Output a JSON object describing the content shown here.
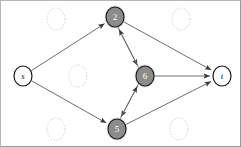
{
  "figure": {
    "type": "directed-graph",
    "title": "",
    "background_color": "#ffffff",
    "border_color": "#9a9a9a",
    "width": 241,
    "height": 147
  },
  "graph": {
    "node_fill_active": "#8c8c8c",
    "node_fill_terminal": "#ffffff",
    "node_stroke": "#1a1a1a",
    "node_text_active": "#ffffff",
    "node_text_terminal": "#1a1a1a",
    "edge_color": "#6e6e6e",
    "ghost_color": "#d9c9c9",
    "nodes": [
      {
        "id": "s",
        "label": "s",
        "x": 22,
        "y": 75,
        "rx": 9,
        "ry": 10,
        "style": "terminal",
        "italic": true
      },
      {
        "id": "n2",
        "label": "2",
        "x": 114,
        "y": 16,
        "rx": 9,
        "ry": 10,
        "style": "active",
        "italic": false
      },
      {
        "id": "n6",
        "label": "6",
        "x": 144,
        "y": 75,
        "rx": 9,
        "ry": 10,
        "style": "active",
        "italic": false
      },
      {
        "id": "n5",
        "label": "5",
        "x": 116,
        "y": 128,
        "rx": 9,
        "ry": 10,
        "style": "active",
        "italic": false
      },
      {
        "id": "t",
        "label": "t",
        "x": 221,
        "y": 75,
        "rx": 9,
        "ry": 10,
        "style": "terminal",
        "italic": true
      }
    ],
    "ghost_nodes": [
      {
        "id": "ghost-top-left",
        "x": 55,
        "y": 18,
        "rx": 9,
        "ry": 11
      },
      {
        "id": "ghost-top-right",
        "x": 180,
        "y": 18,
        "rx": 9,
        "ry": 11
      },
      {
        "id": "ghost-mid-left",
        "x": 77,
        "y": 75,
        "rx": 9,
        "ry": 11
      },
      {
        "id": "ghost-bottom-left",
        "x": 55,
        "y": 128,
        "rx": 9,
        "ry": 11
      },
      {
        "id": "ghost-bottom-right",
        "x": 178,
        "y": 128,
        "rx": 9,
        "ry": 11
      }
    ],
    "edges": [
      {
        "id": "s-to-2",
        "from": "s",
        "to": "n2",
        "label": "",
        "offset": 0
      },
      {
        "id": "s-to-5",
        "from": "s",
        "to": "n5",
        "label": "",
        "offset": 0
      },
      {
        "id": "2-to-6",
        "from": "n2",
        "to": "n6",
        "label": "",
        "offset": 2
      },
      {
        "id": "6-to-2",
        "from": "n6",
        "to": "n2",
        "label": "",
        "offset": -2
      },
      {
        "id": "6-to-5",
        "from": "n6",
        "to": "n5",
        "label": "",
        "offset": 2
      },
      {
        "id": "5-to-6",
        "from": "n5",
        "to": "n6",
        "label": "",
        "offset": -2
      },
      {
        "id": "2-to-t",
        "from": "n2",
        "to": "t",
        "label": "",
        "offset": 0
      },
      {
        "id": "6-to-t",
        "from": "n6",
        "to": "t",
        "label": "",
        "offset": 0
      },
      {
        "id": "5-to-t",
        "from": "n5",
        "to": "t",
        "label": "",
        "offset": 0
      }
    ]
  },
  "labels": {
    "source": "s",
    "sink": "t",
    "node_2": "2",
    "node_6": "6",
    "node_5": "5"
  }
}
